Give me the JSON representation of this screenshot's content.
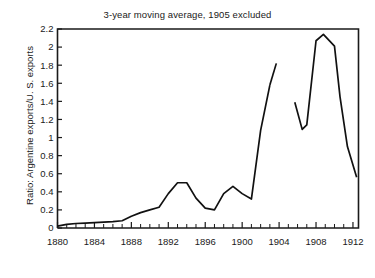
{
  "chart_data": {
    "type": "line",
    "title": "3-year moving average, 1905 excluded",
    "xlabel": "",
    "ylabel": "Ratio: Argentine exports/U. S. exports",
    "xlim": [
      1880,
      1912.6
    ],
    "ylim": [
      0,
      2.2
    ],
    "grid": false,
    "legend": null,
    "y_ticks": [
      0,
      0.2,
      0.4,
      0.6,
      0.8,
      1,
      1.2,
      1.4,
      1.6,
      1.8,
      2,
      2.2
    ],
    "y_tick_labels": [
      "0",
      "0.2",
      "0.4",
      "0.6",
      "0.8",
      "1",
      "1.2",
      "1.4",
      "1.6",
      "1.8",
      "2",
      "2.2"
    ],
    "x_ticks": [
      1880,
      1884,
      1888,
      1892,
      1896,
      1900,
      1904,
      1908,
      1912
    ],
    "x_tick_labels": [
      "1880",
      "1884",
      "1888",
      "1892",
      "1896",
      "1900",
      "1904",
      "1908",
      "1912"
    ],
    "x_minor_tick_step": 1,
    "series": [
      {
        "name": "Ratio: Argentine exports/U. S. exports",
        "color": "#111111",
        "segments": [
          {
            "name": "1880-1903",
            "x": [
              1880,
              1881,
              1882,
              1883,
              1884,
              1885,
              1886,
              1887,
              1888,
              1889,
              1890,
              1891,
              1892,
              1893,
              1894,
              1895,
              1896,
              1897,
              1898,
              1899,
              1900,
              1901,
              1902,
              1903
            ],
            "y": [
              0.02,
              0.04,
              0.05,
              0.055,
              0.06,
              0.065,
              0.07,
              0.08,
              0.13,
              0.17,
              0.2,
              0.23,
              0.38,
              0.5,
              0.5,
              0.33,
              0.22,
              0.2,
              0.38,
              0.46,
              0.38,
              0.32,
              1.08,
              1.58
            ]
          },
          {
            "name": "1903-1904",
            "x": [
              1903,
              1903.7
            ],
            "y": [
              1.58,
              1.82
            ]
          },
          {
            "name": "1906-1912",
            "x": [
              1905.7,
              1906.5,
              1907,
              1908,
              1908.8,
              1910,
              1910.6,
              1911.4,
              1912.4
            ],
            "y": [
              1.39,
              1.09,
              1.14,
              2.07,
              2.14,
              2.01,
              1.45,
              0.9,
              0.56
            ]
          }
        ]
      }
    ]
  },
  "figure": {
    "background_color": "#ffffff",
    "axis_color": "#1a1a1a"
  }
}
